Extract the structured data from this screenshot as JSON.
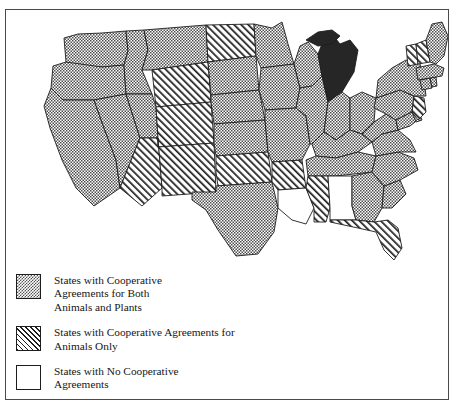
{
  "figure": {
    "clipped_header_text": "",
    "title": "States with Cooperative Agreements"
  },
  "legend": {
    "items": [
      {
        "swatch": "dithered-gray",
        "label": "States with Cooperative\nAgreements for Both\nAnimals and Plants",
        "category": "both"
      },
      {
        "swatch": "diagonal-hatch",
        "label": "States with Cooperative Agreements for\nAnimals Only",
        "category": "animals-only"
      },
      {
        "swatch": "white",
        "label": "States with No Cooperative\nAgreements",
        "category": "none"
      }
    ]
  },
  "colors": {
    "outline": "#1d1d1d",
    "frame": "#4a4a4a",
    "fill_both": "#808080",
    "fill_animals": "#ffffff",
    "fill_none": "#ffffff",
    "fill_solid_highlight": "#262626",
    "background": "#ffffff"
  },
  "map_data": {
    "type": "choropleth",
    "region": "United States (contiguous 48 states)",
    "categories": [
      "both",
      "animals-only",
      "none",
      "solid-highlight"
    ],
    "states": [
      {
        "name": "Washington",
        "category": "both"
      },
      {
        "name": "Oregon",
        "category": "both"
      },
      {
        "name": "California",
        "category": "both"
      },
      {
        "name": "Nevada",
        "category": "both"
      },
      {
        "name": "Idaho",
        "category": "both"
      },
      {
        "name": "Montana",
        "category": "both"
      },
      {
        "name": "Wyoming",
        "category": "animals-only"
      },
      {
        "name": "Utah",
        "category": "both"
      },
      {
        "name": "Arizona",
        "category": "animals-only"
      },
      {
        "name": "Colorado",
        "category": "animals-only"
      },
      {
        "name": "New Mexico",
        "category": "animals-only"
      },
      {
        "name": "North Dakota",
        "category": "animals-only"
      },
      {
        "name": "South Dakota",
        "category": "both"
      },
      {
        "name": "Nebraska",
        "category": "both"
      },
      {
        "name": "Kansas",
        "category": "animals-only"
      },
      {
        "name": "Oklahoma",
        "category": "animals-only"
      },
      {
        "name": "Texas",
        "category": "both"
      },
      {
        "name": "Minnesota",
        "category": "both"
      },
      {
        "name": "Iowa",
        "category": "both"
      },
      {
        "name": "Missouri",
        "category": "both"
      },
      {
        "name": "Arkansas",
        "category": "animals-only"
      },
      {
        "name": "Louisiana",
        "category": "none"
      },
      {
        "name": "Wisconsin",
        "category": "both"
      },
      {
        "name": "Illinois",
        "category": "both"
      },
      {
        "name": "Michigan",
        "category": "solid-highlight"
      },
      {
        "name": "Indiana",
        "category": "both"
      },
      {
        "name": "Ohio",
        "category": "both"
      },
      {
        "name": "Kentucky",
        "category": "both"
      },
      {
        "name": "Tennessee",
        "category": "both"
      },
      {
        "name": "Mississippi",
        "category": "animals-only"
      },
      {
        "name": "Alabama",
        "category": "none"
      },
      {
        "name": "Georgia",
        "category": "both"
      },
      {
        "name": "Florida",
        "category": "animals-only"
      },
      {
        "name": "South Carolina",
        "category": "both"
      },
      {
        "name": "North Carolina",
        "category": "both"
      },
      {
        "name": "Virginia",
        "category": "both"
      },
      {
        "name": "West Virginia",
        "category": "both"
      },
      {
        "name": "Maryland",
        "category": "both"
      },
      {
        "name": "Delaware",
        "category": "both"
      },
      {
        "name": "Pennsylvania",
        "category": "both"
      },
      {
        "name": "New Jersey",
        "category": "animals-only"
      },
      {
        "name": "New York",
        "category": "both"
      },
      {
        "name": "Connecticut",
        "category": "both"
      },
      {
        "name": "Rhode Island",
        "category": "both"
      },
      {
        "name": "Massachusetts",
        "category": "both"
      },
      {
        "name": "Vermont",
        "category": "animals-only"
      },
      {
        "name": "New Hampshire",
        "category": "animals-only"
      },
      {
        "name": "Maine",
        "category": "both"
      }
    ]
  }
}
